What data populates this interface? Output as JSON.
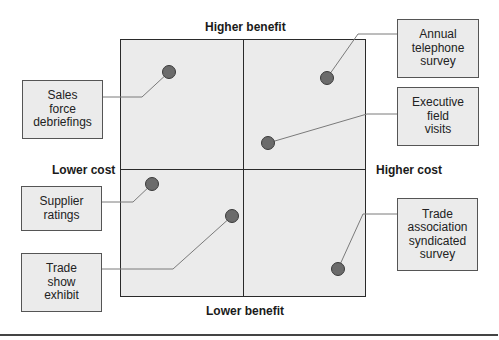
{
  "diagram": {
    "type": "quadrant",
    "axes": {
      "top": "Higher benefit",
      "bottom": "Lower benefit",
      "left": "Lower cost",
      "right": "Higher cost"
    },
    "items": [
      {
        "label_lines": [
          "Sales",
          "force",
          "debriefings"
        ],
        "quadrant": "lower-cost/higher-benefit"
      },
      {
        "label_lines": [
          "Annual",
          "telephone",
          "survey"
        ],
        "quadrant": "higher-cost/higher-benefit"
      },
      {
        "label_lines": [
          "Executive",
          "field",
          "visits"
        ],
        "quadrant": "higher-cost/higher-benefit"
      },
      {
        "label_lines": [
          "Supplier",
          "ratings"
        ],
        "quadrant": "lower-cost/lower-benefit"
      },
      {
        "label_lines": [
          "Trade",
          "show",
          "exhibit"
        ],
        "quadrant": "lower-cost/lower-benefit"
      },
      {
        "label_lines": [
          "Trade",
          "association",
          "syndicated",
          "survey"
        ],
        "quadrant": "higher-cost/lower-benefit"
      }
    ],
    "colors": {
      "grid_fill": "#ebebeb",
      "dot_fill": "#6b6b6b",
      "border": "#2a2a2a"
    }
  }
}
